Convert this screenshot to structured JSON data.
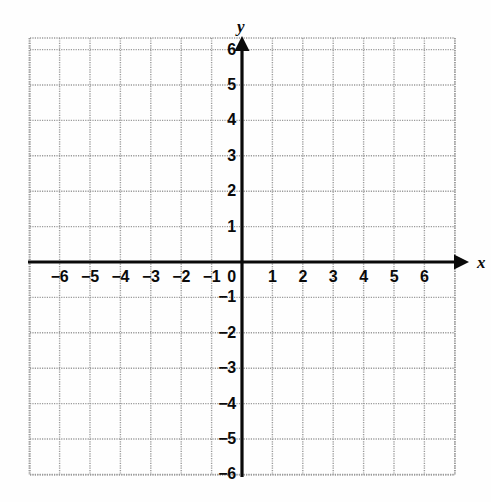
{
  "chart_data": {
    "type": "scatter",
    "title": "",
    "subtitle": "",
    "xlabel": "x",
    "ylabel": "y",
    "xlim": [
      -7,
      7
    ],
    "ylim": [
      -7,
      7
    ],
    "grid": true,
    "legend": null,
    "series": [],
    "x": [],
    "y": [],
    "x_ticks": [
      -6,
      -5,
      -4,
      -3,
      -2,
      -1,
      0,
      1,
      2,
      3,
      4,
      5,
      6
    ],
    "y_ticks": [
      6,
      5,
      4,
      3,
      2,
      1,
      -1,
      -2,
      -3,
      -4,
      -5,
      -6
    ],
    "x_tick_labels": [
      "−6",
      "−5",
      "−4",
      "−3",
      "−2",
      "−1",
      "0",
      "1",
      "2",
      "3",
      "4",
      "5",
      "6"
    ],
    "y_tick_labels": [
      "6",
      "5",
      "4",
      "3",
      "2",
      "1",
      "−1",
      "−2",
      "−3",
      "−4",
      "−5",
      "−6"
    ],
    "annotations": []
  },
  "axes": {
    "x_axis_name": "x",
    "y_axis_name": "y",
    "origin_label": "0",
    "x_labels": [
      {
        "value": -6,
        "text": "−6"
      },
      {
        "value": -5,
        "text": "−5"
      },
      {
        "value": -4,
        "text": "−4"
      },
      {
        "value": -3,
        "text": "−3"
      },
      {
        "value": -2,
        "text": "−2"
      },
      {
        "value": -1,
        "text": "−1"
      },
      {
        "value": 1,
        "text": "1"
      },
      {
        "value": 2,
        "text": "2"
      },
      {
        "value": 3,
        "text": "3"
      },
      {
        "value": 4,
        "text": "4"
      },
      {
        "value": 5,
        "text": "5"
      },
      {
        "value": 6,
        "text": "6"
      }
    ],
    "y_labels": [
      {
        "value": 6,
        "text": "6"
      },
      {
        "value": 5,
        "text": "5"
      },
      {
        "value": 4,
        "text": "4"
      },
      {
        "value": 3,
        "text": "3"
      },
      {
        "value": 2,
        "text": "2"
      },
      {
        "value": 1,
        "text": "1"
      },
      {
        "value": -1,
        "text": "−1"
      },
      {
        "value": -2,
        "text": "−2"
      },
      {
        "value": -3,
        "text": "−3"
      },
      {
        "value": -4,
        "text": "−4"
      },
      {
        "value": -5,
        "text": "−5"
      },
      {
        "value": -6,
        "text": "−6"
      }
    ]
  },
  "colors": {
    "background": "#fefefe",
    "grid_line": "#9a9a9a",
    "axis_line": "#0a0a0a",
    "label_text": "#0a0a0a"
  },
  "geometry": {
    "origin_x": 242,
    "origin_y": 262,
    "unit_x": 30.4,
    "unit_y": 35.4,
    "grid_left": 30,
    "grid_right": 455,
    "grid_top": 38,
    "grid_bottom": 475,
    "x_arrow_tip": 469,
    "y_arrow_tip": 36
  }
}
